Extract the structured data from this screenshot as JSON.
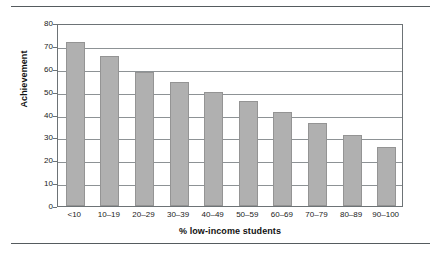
{
  "chart_data": {
    "type": "bar",
    "title": "",
    "xlabel": "% low-income students",
    "ylabel": "Achievement",
    "categories": [
      "<10",
      "10–19",
      "20–29",
      "30–39",
      "40–49",
      "50–59",
      "60–69",
      "70–79",
      "80–89",
      "90–100"
    ],
    "values": [
      71.5,
      65.5,
      58.8,
      54.2,
      50,
      46,
      41,
      36.3,
      31,
      26
    ],
    "ylim": [
      0,
      80
    ],
    "yticks": [
      0,
      10,
      20,
      30,
      40,
      50,
      60,
      70,
      80
    ],
    "ytick_labels": [
      "0",
      "10",
      "20",
      "30",
      "40",
      "50",
      "60",
      "70",
      "80"
    ],
    "grid": "horizontal",
    "legend": "none",
    "bar_color": "#b0b0b0",
    "bar_border_color": "#949494",
    "gridline_color": "#8d9295",
    "axis_color": "#6d7376",
    "rule_color": "#555b5e",
    "background": "#ffffff"
  }
}
